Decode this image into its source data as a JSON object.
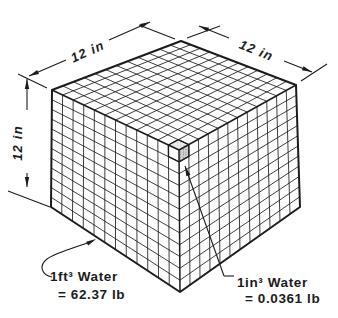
{
  "diagram": {
    "type": "cubic-foot-of-water-cutaway",
    "grid_divisions": 12,
    "dimension_labels": {
      "top_left": "12 in",
      "top_right": "12 in",
      "left": "12 in"
    },
    "annotations": {
      "cubic_foot": {
        "line1": "1ft³ Water",
        "line2": "= 62.37 lb"
      },
      "cubic_inch": {
        "line1": "1in³ Water",
        "line2": "= 0.0361 lb"
      }
    },
    "colors": {
      "line": "#1c1c1c",
      "background": "#ffffff",
      "highlight_top_bg": "#ededed",
      "highlight_top_dot": "#9a9a9a",
      "highlight_side_bg": "#d2d2d2",
      "highlight_side_dot": "#707070"
    }
  }
}
